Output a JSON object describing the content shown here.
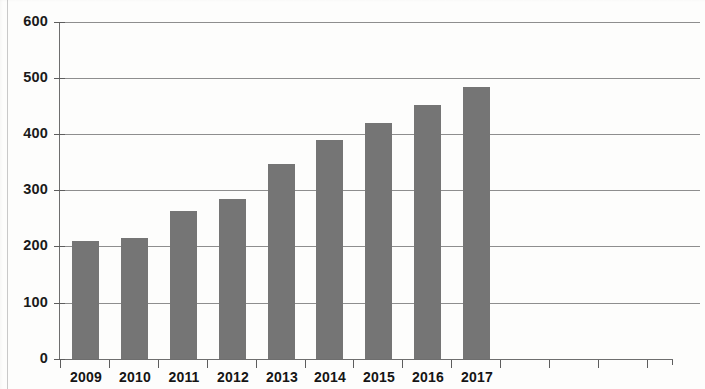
{
  "chart_data": {
    "type": "bar",
    "title": "",
    "subtitle": "",
    "xlabel": "",
    "ylabel": "",
    "categories": [
      "2009",
      "2010",
      "2011",
      "2012",
      "2013",
      "2014",
      "2015",
      "2016",
      "2017"
    ],
    "values": [
      210,
      215,
      264,
      285,
      348,
      390,
      420,
      453,
      485
    ],
    "series": [
      {
        "name": "",
        "values": [
          210,
          215,
          264,
          285,
          348,
          390,
          420,
          453,
          485
        ]
      }
    ],
    "ylim": [
      0,
      600
    ],
    "yticks": [
      0,
      100,
      200,
      300,
      400,
      500,
      600
    ],
    "ytick_labels": [
      "0",
      "100",
      "200",
      "300",
      "400",
      "500",
      "600"
    ],
    "grid": true,
    "grid_axis": "y",
    "legend": false,
    "legend_position": "none",
    "bar_color": "#757575",
    "gridline_color": "#8e8e8e",
    "axis_color": "#6e6e6e",
    "label_color": "#151515",
    "extra_unlabeled_xticks": 4,
    "annotations": []
  }
}
